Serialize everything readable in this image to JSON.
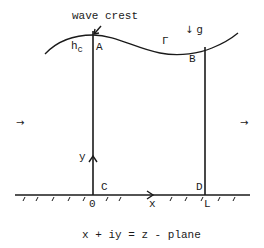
{
  "diagram": {
    "title_annotation": "wave crest",
    "labels": {
      "h_c": "h",
      "h_c_sub": "c",
      "A": "A",
      "B": "B",
      "C": "C",
      "D": "D",
      "Gamma": "Γ",
      "gravity": "↓ g",
      "y_axis": "y",
      "x_axis": "x",
      "origin": "0",
      "L": "L",
      "left_arrow": "→",
      "right_arrow": "→"
    },
    "caption": "x + iy = z - plane",
    "colors": {
      "stroke": "#1a1a1a",
      "background": "#ffffff"
    }
  }
}
